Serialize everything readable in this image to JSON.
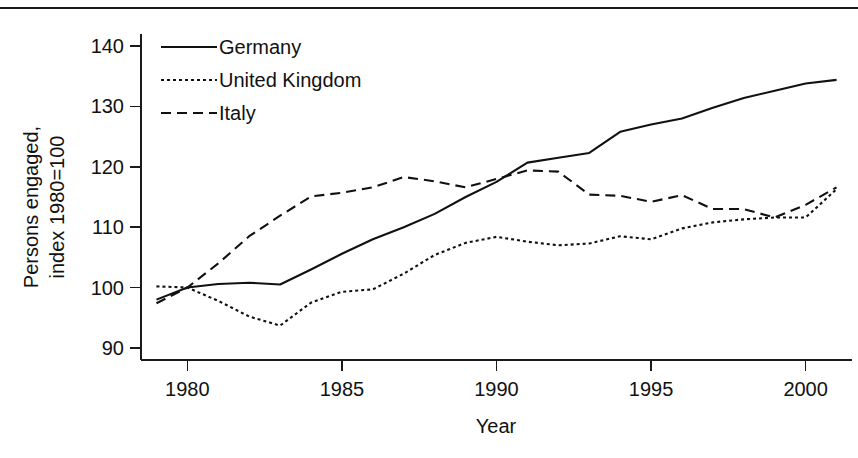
{
  "figure": {
    "background": "#ffffff",
    "ink_color": "#111111",
    "top_rule": true
  },
  "chart_data": {
    "type": "line",
    "title": "",
    "xlabel": "Year",
    "ylabel": "Persons engaged, index 1980=100",
    "ylabel_line1": "Persons engaged,",
    "ylabel_line2": "index 1980=100",
    "xlim": [
      1978.5,
      2001.5
    ],
    "ylim": [
      88.0,
      142.0
    ],
    "xticks": [
      1980,
      1985,
      1990,
      1995,
      2000
    ],
    "xtick_labels": [
      "1980",
      "1985",
      "1990",
      "1995",
      "2000"
    ],
    "yticks": [
      90,
      100,
      110,
      120,
      130,
      140
    ],
    "ytick_labels": [
      "90",
      "100",
      "110",
      "120",
      "130",
      "140"
    ],
    "grid": false,
    "legend_position": "top-left-inside",
    "x": [
      1979,
      1980,
      1981,
      1982,
      1983,
      1984,
      1985,
      1986,
      1987,
      1988,
      1989,
      1990,
      1991,
      1992,
      1993,
      1994,
      1995,
      1996,
      1997,
      1998,
      1999,
      2000,
      2001
    ],
    "series": [
      {
        "name": "Germany",
        "dash": "solid",
        "dasharray": "none",
        "values": [
          98.0,
          100.0,
          100.6,
          100.8,
          100.5,
          103.0,
          105.6,
          108.0,
          110.0,
          112.2,
          115.0,
          117.5,
          120.7,
          121.5,
          122.3,
          125.8,
          127.0,
          128.0,
          129.8,
          131.4,
          132.6,
          133.8,
          134.4
        ]
      },
      {
        "name": "United Kingdom",
        "dash": "dotted",
        "dasharray": "3,3",
        "values": [
          100.2,
          100.0,
          97.8,
          95.2,
          93.7,
          97.5,
          99.3,
          99.7,
          102.3,
          105.4,
          107.4,
          108.4,
          107.6,
          107.0,
          107.3,
          108.5,
          108.0,
          109.8,
          110.8,
          111.3,
          111.6,
          111.6,
          116.3
        ]
      },
      {
        "name": "Italy",
        "dash": "dashed",
        "dasharray": "10,6",
        "values": [
          97.4,
          100.0,
          104.0,
          108.5,
          111.9,
          115.1,
          115.7,
          116.6,
          118.3,
          117.6,
          116.6,
          118.0,
          119.4,
          119.2,
          115.4,
          115.2,
          114.2,
          115.3,
          113.0,
          113.0,
          111.6,
          113.7,
          116.6
        ]
      }
    ]
  },
  "legend": {
    "entries": [
      {
        "label": "Germany",
        "dasharray": "none"
      },
      {
        "label": "United Kingdom",
        "dasharray": "3,3"
      },
      {
        "label": "Italy",
        "dasharray": "10,6"
      }
    ]
  }
}
